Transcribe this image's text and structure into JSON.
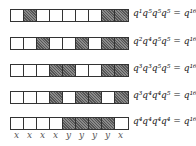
{
  "diagram": {
    "rows": [
      {
        "cells": [
          0,
          1,
          0,
          0,
          0,
          0,
          0,
          1,
          1
        ],
        "label": "q¹q⁵q⁵q⁵ = q¹⁶"
      },
      {
        "cells": [
          0,
          0,
          1,
          0,
          0,
          1,
          0,
          1,
          1
        ],
        "label": "q²q⁴q⁵q⁵ = q¹⁶"
      },
      {
        "cells": [
          0,
          0,
          0,
          1,
          1,
          0,
          0,
          1,
          1
        ],
        "label": "q³q³q⁵q⁵ = q¹⁶"
      },
      {
        "cells": [
          0,
          0,
          0,
          1,
          0,
          1,
          1,
          0,
          1
        ],
        "label": "q³q⁴q⁴q⁵ = q¹⁶"
      },
      {
        "cells": [
          0,
          0,
          0,
          0,
          1,
          1,
          1,
          1,
          0
        ],
        "label": "q⁴q⁴q⁴q⁴ = q¹⁶"
      }
    ],
    "variables": [
      "x",
      "x",
      "x",
      "x",
      "y",
      "y",
      "y",
      "y",
      "x"
    ],
    "colors": {
      "hatched": "#6a6a6a",
      "border": "#333333",
      "empty": "#ffffff"
    }
  }
}
